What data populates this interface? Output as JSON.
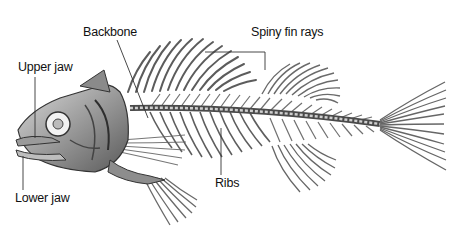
{
  "diagram": {
    "colors": {
      "background": "#ffffff",
      "bone": "#6e6e6e",
      "bone_dark": "#3a3a3a",
      "label": "#111111",
      "leader": "#333333"
    },
    "labels": [
      {
        "id": "backbone",
        "text": "Backbone",
        "x": 83,
        "y": 32
      },
      {
        "id": "spiny-fin-rays",
        "text": "Spiny fin rays",
        "x": 251,
        "y": 32
      },
      {
        "id": "upper-jaw",
        "text": "Upper jaw",
        "x": 18,
        "y": 66
      },
      {
        "id": "lower-jaw",
        "text": "Lower jaw",
        "x": 15,
        "y": 197
      },
      {
        "id": "ribs",
        "text": "Ribs",
        "x": 215,
        "y": 182
      }
    ]
  }
}
